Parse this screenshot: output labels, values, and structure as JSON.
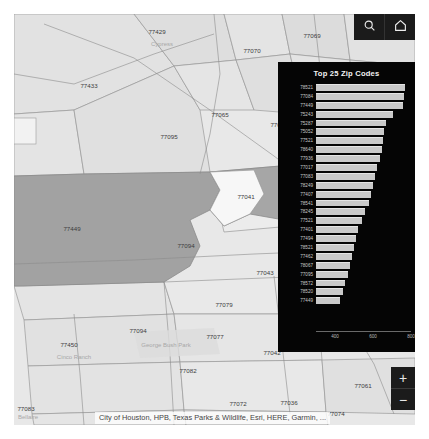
{
  "map": {
    "background_color": "#e6e6e6",
    "highlight_color": "#9f9f9f",
    "attribution": "City of Houston, HPB, Texas Parks & Wildlife, Esri, HERE, Garmin, ...",
    "zip_labels": [
      {
        "text": "77429",
        "x": 143,
        "y": 20
      },
      {
        "text": "77070",
        "x": 238,
        "y": 39
      },
      {
        "text": "77069",
        "x": 298,
        "y": 24
      },
      {
        "text": "77066",
        "x": 317,
        "y": 62
      },
      {
        "text": "77433",
        "x": 75,
        "y": 74
      },
      {
        "text": "77065",
        "x": 206,
        "y": 103
      },
      {
        "text": "77064",
        "x": 265,
        "y": 113
      },
      {
        "text": "77095",
        "x": 155,
        "y": 125
      },
      {
        "text": "77041",
        "x": 232,
        "y": 185
      },
      {
        "text": "77449",
        "x": 58,
        "y": 217
      },
      {
        "text": "77094",
        "x": 172,
        "y": 234
      },
      {
        "text": "77043",
        "x": 251,
        "y": 261
      },
      {
        "text": "77079",
        "x": 210,
        "y": 293
      },
      {
        "text": "77094",
        "x": 124,
        "y": 319
      },
      {
        "text": "77077",
        "x": 201,
        "y": 325
      },
      {
        "text": "77042",
        "x": 258,
        "y": 341
      },
      {
        "text": "77450",
        "x": 55,
        "y": 333
      },
      {
        "text": "77082",
        "x": 174,
        "y": 359
      },
      {
        "text": "77083",
        "x": 4,
        "y": 397
      },
      {
        "text": "77072",
        "x": 224,
        "y": 392
      },
      {
        "text": "77036",
        "x": 275,
        "y": 391
      },
      {
        "text": "77074",
        "x": 322,
        "y": 402
      },
      {
        "text": "77061",
        "x": 349,
        "y": 374
      }
    ],
    "place_labels": [
      {
        "text": "Cypress",
        "x": 148,
        "y": 32
      },
      {
        "text": "Cinco Ranch",
        "x": 60,
        "y": 345
      },
      {
        "text": "George Bush Park",
        "x": 152,
        "y": 333
      },
      {
        "text": "Bellaire",
        "x": 12,
        "y": 405
      }
    ]
  },
  "topright": {
    "search_icon": "search-icon",
    "home_icon": "home-icon"
  },
  "zoom_control": {
    "zoom_in_label": "+",
    "zoom_out_label": "−"
  },
  "chart_data": {
    "type": "bar",
    "orientation": "horizontal",
    "title": "Top 25 Zip Codes",
    "xlabel": "",
    "ylabel": "",
    "grid": false,
    "legend": null,
    "xlim": [
      300,
      800
    ],
    "xticks": [
      400,
      600,
      800
    ],
    "tick_labels": [
      "400",
      "600",
      "800"
    ],
    "categories": [
      "78521",
      "77084",
      "77449",
      "75243",
      "75287",
      "75052",
      "77521",
      "78640",
      "77936",
      "77017",
      "77083",
      "78249",
      "77407",
      "78541",
      "78245",
      "77521",
      "77401",
      "77494",
      "78521",
      "77462",
      "78067",
      "77095",
      "78572",
      "78520",
      "77449"
    ],
    "values": [
      770,
      762,
      758,
      705,
      668,
      660,
      652,
      645,
      635,
      622,
      610,
      600,
      590,
      578,
      560,
      540,
      520,
      512,
      500,
      492,
      480,
      470,
      455,
      440,
      428
    ],
    "bar_color": "#c9c9c9",
    "background_color": "#050505"
  }
}
